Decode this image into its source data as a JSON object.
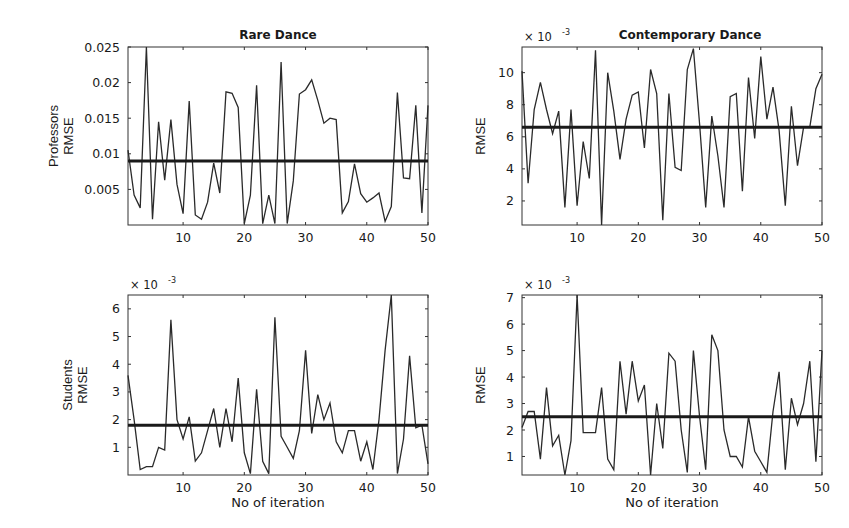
{
  "figure": {
    "xlabel": "No of iteration",
    "x_ticks": [
      "10",
      "20",
      "30",
      "40",
      "50"
    ]
  },
  "panels": [
    {
      "id": "top-left",
      "title": "Rare Dance",
      "ylabel_lines": [
        "Professors",
        "RMSE"
      ],
      "exponent": "",
      "y_ticks": [
        "0.005",
        "0.01",
        "0.015",
        "0.02",
        "0.025"
      ],
      "show_xlabel": false
    },
    {
      "id": "top-right",
      "title": "Contemporary Dance",
      "ylabel_lines": [
        "RMSE"
      ],
      "exponent": "x 10",
      "exponent_power": "-3",
      "y_ticks": [
        "2",
        "4",
        "6",
        "8",
        "10"
      ],
      "show_xlabel": false
    },
    {
      "id": "bottom-left",
      "title": "",
      "ylabel_lines": [
        "Students",
        "RMSE"
      ],
      "exponent": "x 10",
      "exponent_power": "-3",
      "y_ticks": [
        "1",
        "2",
        "3",
        "4",
        "5",
        "6"
      ],
      "show_xlabel": true
    },
    {
      "id": "bottom-right",
      "title": "",
      "ylabel_lines": [
        "RMSE"
      ],
      "exponent": "x 10",
      "exponent_power": "-3",
      "y_ticks": [
        "1",
        "2",
        "3",
        "4",
        "5",
        "6",
        "7"
      ],
      "show_xlabel": true
    }
  ],
  "chart_data": [
    {
      "type": "line",
      "title": "Rare Dance",
      "xlabel": "",
      "ylabel": "Professors RMSE",
      "xlim": [
        1,
        50
      ],
      "ylim": [
        0,
        0.025
      ],
      "grid": false,
      "x": [
        1,
        2,
        3,
        4,
        5,
        6,
        7,
        8,
        9,
        10,
        11,
        12,
        13,
        14,
        15,
        16,
        17,
        18,
        19,
        20,
        21,
        22,
        23,
        24,
        25,
        26,
        27,
        28,
        29,
        30,
        31,
        32,
        33,
        34,
        35,
        36,
        37,
        38,
        39,
        40,
        41,
        42,
        43,
        44,
        45,
        46,
        47,
        48,
        49,
        50
      ],
      "series": [
        {
          "name": "RMSE",
          "values": [
            0.0105,
            0.0042,
            0.0024,
            0.025,
            0.0008,
            0.0145,
            0.0063,
            0.0148,
            0.0057,
            0.0016,
            0.0174,
            0.0014,
            0.0008,
            0.0032,
            0.0087,
            0.0045,
            0.0187,
            0.0185,
            0.0165,
            0.0002,
            0.0042,
            0.0196,
            0.0002,
            0.0042,
            0.0002,
            0.0229,
            0.0002,
            0.0062,
            0.0184,
            0.019,
            0.0204,
            0.0175,
            0.0143,
            0.015,
            0.0148,
            0.0017,
            0.0033,
            0.0086,
            0.0044,
            0.0032,
            0.0038,
            0.0045,
            0.0005,
            0.0026,
            0.0186,
            0.0066,
            0.0065,
            0.0168,
            0.0017,
            0.0168
          ]
        },
        {
          "name": "Mean",
          "values": [
            0.009,
            0.009
          ]
        }
      ],
      "mean": 0.009
    },
    {
      "type": "line",
      "title": "Contemporary Dance",
      "xlabel": "",
      "ylabel": "RMSE (x 10^-3)",
      "xlim": [
        1,
        50
      ],
      "ylim": [
        0.5,
        11.6
      ],
      "grid": false,
      "x": [
        1,
        2,
        3,
        4,
        5,
        6,
        7,
        8,
        9,
        10,
        11,
        12,
        13,
        14,
        15,
        16,
        17,
        18,
        19,
        20,
        21,
        22,
        23,
        24,
        25,
        26,
        27,
        28,
        29,
        30,
        31,
        32,
        33,
        34,
        35,
        36,
        37,
        38,
        39,
        40,
        41,
        42,
        43,
        44,
        45,
        46,
        47,
        48,
        49,
        50
      ],
      "series": [
        {
          "name": "RMSE",
          "values": [
            10.1,
            3.1,
            7.7,
            9.4,
            7.7,
            6.2,
            7.6,
            1.6,
            7.7,
            1.7,
            5.7,
            3.4,
            11.4,
            0.5,
            10.0,
            7.6,
            4.6,
            7.1,
            8.6,
            8.8,
            5.3,
            10.2,
            8.7,
            0.8,
            8.7,
            4.1,
            3.9,
            10.2,
            11.5,
            6.8,
            1.6,
            7.3,
            4.8,
            1.6,
            8.5,
            8.7,
            2.6,
            9.7,
            5.9,
            11.0,
            7.1,
            9.1,
            6.4,
            1.7,
            7.9,
            4.2,
            6.6,
            6.6,
            9.0,
            9.9
          ]
        },
        {
          "name": "Mean",
          "values": [
            6.6,
            6.6
          ]
        }
      ],
      "mean": 6.6
    },
    {
      "type": "line",
      "title": "",
      "xlabel": "No of iteration",
      "ylabel": "Students RMSE (x 10^-3)",
      "xlim": [
        1,
        50
      ],
      "ylim": [
        0,
        6.5
      ],
      "grid": false,
      "x": [
        1,
        2,
        3,
        4,
        5,
        6,
        7,
        8,
        9,
        10,
        11,
        12,
        13,
        14,
        15,
        16,
        17,
        18,
        19,
        20,
        21,
        22,
        23,
        24,
        25,
        26,
        27,
        28,
        29,
        30,
        31,
        32,
        33,
        34,
        35,
        36,
        37,
        38,
        39,
        40,
        41,
        42,
        43,
        44,
        45,
        46,
        47,
        48,
        49,
        50
      ],
      "series": [
        {
          "name": "RMSE",
          "values": [
            3.6,
            2.0,
            0.2,
            0.3,
            0.3,
            1.0,
            0.9,
            5.6,
            2.0,
            1.3,
            2.1,
            0.5,
            0.8,
            1.6,
            2.4,
            1.0,
            2.4,
            1.2,
            3.5,
            0.8,
            0.05,
            3.1,
            0.5,
            0.05,
            5.7,
            1.4,
            1.0,
            0.6,
            1.6,
            4.5,
            1.5,
            2.9,
            2.0,
            2.6,
            1.2,
            0.8,
            1.6,
            1.6,
            0.5,
            1.2,
            0.2,
            2.0,
            4.5,
            6.5,
            0.05,
            1.3,
            4.3,
            1.7,
            1.8,
            0.4
          ]
        },
        {
          "name": "Mean",
          "values": [
            1.8,
            1.8
          ]
        }
      ],
      "mean": 1.8
    },
    {
      "type": "line",
      "title": "",
      "xlabel": "No of iteration",
      "ylabel": "RMSE (x 10^-3)",
      "xlim": [
        1,
        50
      ],
      "ylim": [
        0.3,
        7.1
      ],
      "grid": false,
      "x": [
        1,
        2,
        3,
        4,
        5,
        6,
        7,
        8,
        9,
        10,
        11,
        12,
        13,
        14,
        15,
        16,
        17,
        18,
        19,
        20,
        21,
        22,
        23,
        24,
        25,
        26,
        27,
        28,
        29,
        30,
        31,
        32,
        33,
        34,
        35,
        36,
        37,
        38,
        39,
        40,
        41,
        42,
        43,
        44,
        45,
        46,
        47,
        48,
        49,
        50
      ],
      "series": [
        {
          "name": "RMSE",
          "values": [
            2.1,
            2.7,
            2.7,
            0.9,
            3.6,
            1.4,
            1.8,
            0.3,
            1.6,
            7.1,
            1.9,
            1.9,
            1.9,
            3.6,
            0.9,
            0.5,
            4.6,
            2.6,
            4.6,
            3.1,
            3.7,
            0.3,
            3.0,
            1.3,
            4.9,
            4.6,
            2.0,
            0.4,
            5.0,
            2.5,
            0.5,
            5.6,
            5.0,
            2.0,
            1.0,
            1.0,
            0.6,
            2.5,
            1.2,
            0.8,
            0.4,
            2.7,
            4.2,
            0.5,
            3.2,
            2.2,
            3.0,
            4.6,
            0.8,
            5.0
          ]
        },
        {
          "name": "Mean",
          "values": [
            2.5,
            2.5
          ]
        }
      ],
      "mean": 2.5
    }
  ]
}
